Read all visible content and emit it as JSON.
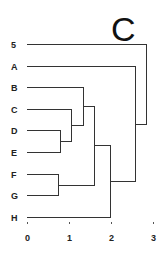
{
  "panel_label": "C",
  "chart_data": {
    "type": "dendrogram",
    "title": "C",
    "orientation": "horizontal",
    "leaves": [
      "5",
      "A",
      "B",
      "C",
      "D",
      "E",
      "F",
      "G",
      "H"
    ],
    "xlabel": "",
    "xticks": [
      "0",
      "1",
      "2",
      "3"
    ],
    "xlim": [
      0,
      3
    ],
    "merges": [
      {
        "id": "DE",
        "children": [
          "D",
          "E"
        ],
        "height": 0.79
      },
      {
        "id": "FG",
        "children": [
          "F",
          "G"
        ],
        "height": 0.74
      },
      {
        "id": "CDE",
        "children": [
          "C",
          "DE"
        ],
        "height": 1.05
      },
      {
        "id": "BCDE",
        "children": [
          "B",
          "CDE"
        ],
        "height": 1.33
      },
      {
        "id": "BCDEFG",
        "children": [
          "BCDE",
          "FG"
        ],
        "height": 1.6
      },
      {
        "id": "BCDEFGH",
        "children": [
          "BCDEFG",
          "H"
        ],
        "height": 1.98
      },
      {
        "id": "ABCDEFGH",
        "children": [
          "A",
          "BCDEFGH"
        ],
        "height": 2.57
      },
      {
        "id": "root",
        "children": [
          "5",
          "ABCDEFGH"
        ],
        "height": 2.83
      }
    ]
  },
  "axis": {
    "ticks": [
      {
        "label": "0",
        "value": 0
      },
      {
        "label": "1",
        "value": 1
      },
      {
        "label": "2",
        "value": 2
      },
      {
        "label": "3",
        "value": 3
      }
    ]
  },
  "colors": {
    "line": "#333333",
    "text": "#222222",
    "background": "#ffffff"
  }
}
